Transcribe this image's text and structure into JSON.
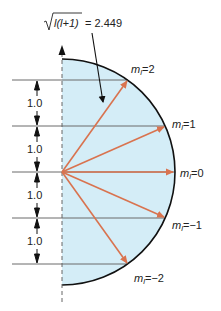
{
  "diagram": {
    "title_label": {
      "sqrt_content": "l(l+1)",
      "equals": "= 2.449"
    },
    "spacing_labels": [
      "1.0",
      "1.0",
      "1.0",
      "1.0"
    ],
    "ml_labels": [
      {
        "prefix": "m",
        "sub": "l",
        "value": "=2"
      },
      {
        "prefix": "m",
        "sub": "l",
        "value": "=1"
      },
      {
        "prefix": "m",
        "sub": "l",
        "value": "=0"
      },
      {
        "prefix": "m",
        "sub": "l",
        "value": "=−1"
      },
      {
        "prefix": "m",
        "sub": "l",
        "value": "=−2"
      }
    ],
    "colors": {
      "fill": "#d4edf7",
      "vector": "#d9734f",
      "arc": "#111111",
      "lines": "#6b6b6b",
      "axis": "#666666"
    },
    "l": 2,
    "vector_magnitude": 2.449
  }
}
